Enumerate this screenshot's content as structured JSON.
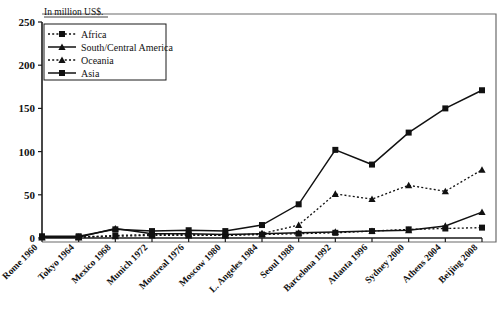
{
  "chart_data": {
    "type": "line",
    "title": "",
    "subtitle": "",
    "xlabel": "",
    "ylabel": "In million US$.",
    "ylim": [
      0,
      250
    ],
    "yticks": [
      0,
      50,
      100,
      150,
      200,
      250
    ],
    "grid": false,
    "legend_position": "top-left",
    "categories": [
      "Rome 1960",
      "Tokyo 1964",
      "Mexico 1968",
      "Munich 1972",
      "Montreal 1976",
      "Moscow 1980",
      "L. Angeles 1984",
      "Seoul 1988",
      "Barcelona 1992",
      "Atlanta 1996",
      "Sydney 2000",
      "Athens 2004",
      "Beijing 2008"
    ],
    "series": [
      {
        "name": "Africa",
        "line_style": "dotted",
        "marker": "square",
        "values": [
          1,
          1,
          3,
          4,
          4,
          3,
          4,
          5,
          6,
          8,
          10,
          11,
          12
        ]
      },
      {
        "name": "South/Central America",
        "line_style": "solid",
        "marker": "triangle",
        "values": [
          1,
          1,
          11,
          5,
          5,
          4,
          5,
          6,
          7,
          8,
          9,
          14,
          30
        ]
      },
      {
        "name": "Oceania",
        "line_style": "dotted",
        "marker": "triangle",
        "values": [
          1,
          1,
          2,
          3,
          3,
          3,
          5,
          15,
          51,
          45,
          61,
          54,
          79
        ]
      },
      {
        "name": "Asia",
        "line_style": "solid",
        "marker": "square",
        "values": [
          2,
          2,
          10,
          8,
          9,
          8,
          15,
          39,
          102,
          85,
          122,
          150,
          171
        ]
      }
    ]
  },
  "axis": {
    "y_title": "In million US$.",
    "y_tick_labels": [
      "250",
      "200",
      "150",
      "100",
      "50",
      "0"
    ]
  },
  "legend": {
    "entries": [
      {
        "label": "Africa"
      },
      {
        "label": "South/Central America"
      },
      {
        "label": "Oceania"
      },
      {
        "label": "Asia"
      }
    ]
  },
  "colors": {
    "ink": "#111111",
    "frame": "#6b6b6b",
    "background": "#ffffff"
  }
}
